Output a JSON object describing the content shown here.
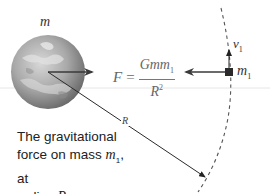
{
  "figure": {
    "planet_label": "m",
    "formula": {
      "lhs": "F",
      "equals": "=",
      "numerator": "Gmm",
      "numerator_sub": "1",
      "denominator": "R",
      "denominator_sup": "2"
    },
    "mass_label": "m",
    "mass_label_sub": "1",
    "velocity_label": "v",
    "velocity_label_sub": "1",
    "radius_label": "R",
    "caption": {
      "line1": "The gravitational",
      "line2_prefix": "force on mass ",
      "line2_var": "m",
      "line2_sub": "1",
      "line2_suffix": ", at",
      "line3_prefix": "radius ",
      "line3_var": "R"
    }
  },
  "colors": {
    "arrow": "#3a3a3a",
    "planet_dark": "#6e6e6e",
    "planet_light": "#c8c8c8",
    "orbit_dash": "#555555",
    "text": "#222222"
  },
  "icons": {
    "planet": "earth-globe-icon",
    "mass": "square-mass-icon",
    "force_arrow": "arrow-left-icon",
    "velocity_arrow": "arrow-up-icon"
  }
}
